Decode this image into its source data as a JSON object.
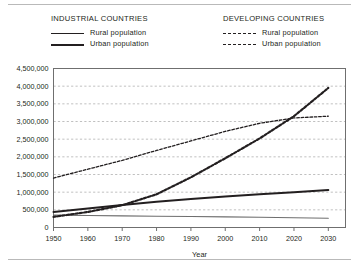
{
  "figure": {
    "legends": [
      {
        "title": "INDUSTRIAL COUNTRIES",
        "entries": [
          {
            "label": "Rural population",
            "style": "solid-thin"
          },
          {
            "label": "Urban population",
            "style": "solid-thick"
          }
        ]
      },
      {
        "title": "DEVELOPING COUNTRIES",
        "entries": [
          {
            "label": "Rural population",
            "style": "dash-thin"
          },
          {
            "label": "Urban population",
            "style": "dash-thick"
          }
        ]
      }
    ]
  },
  "chart_data": {
    "type": "line",
    "title": "",
    "xlabel": "Year",
    "ylabel": "",
    "x": [
      1950,
      1960,
      1970,
      1980,
      1990,
      2000,
      2010,
      2020,
      2030
    ],
    "xlim": [
      1950,
      2035
    ],
    "ylim": [
      0,
      4500000
    ],
    "ytick_labels": [
      "0",
      "500,000",
      "1,000,000",
      "1,500,000",
      "2,000,000",
      "2,500,000",
      "3,000,000",
      "3,500,000",
      "4,000,000",
      "4,500,000"
    ],
    "ytick_values": [
      0,
      500000,
      1000000,
      1500000,
      2000000,
      2500000,
      3000000,
      3500000,
      4000000,
      4500000
    ],
    "xtick_labels": [
      "1950",
      "1960",
      "1970",
      "1980",
      "1990",
      "2000",
      "2010",
      "2020",
      "2030"
    ],
    "grid": true,
    "legend_position": "above-plot",
    "series": [
      {
        "name": "Industrial countries - Rural population",
        "style": "solid-thin",
        "color": "#6e6e6e",
        "values": [
          350000,
          340000,
          330000,
          320000,
          310000,
          300000,
          290000,
          275000,
          260000
        ]
      },
      {
        "name": "Industrial countries - Urban population",
        "style": "solid-thick",
        "color": "#231f20",
        "values": [
          440000,
          540000,
          640000,
          730000,
          810000,
          880000,
          940000,
          1000000,
          1060000
        ]
      },
      {
        "name": "Developing countries - Rural population",
        "style": "dash-thin",
        "color": "#231f20",
        "values": [
          1400000,
          1650000,
          1900000,
          2180000,
          2450000,
          2720000,
          2950000,
          3100000,
          3150000
        ]
      },
      {
        "name": "Developing countries - Urban population",
        "style": "dash-thick",
        "color": "#231f20",
        "values": [
          300000,
          440000,
          630000,
          940000,
          1420000,
          1960000,
          2520000,
          3150000,
          3950000
        ]
      }
    ]
  }
}
